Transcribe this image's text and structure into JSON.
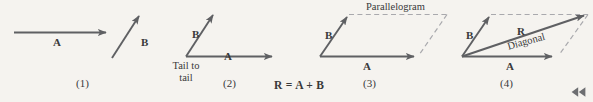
{
  "figure": {
    "colors": {
      "background": "#f5f3ef",
      "vector_stroke": "#5f6063",
      "dashed_stroke": "#a9a9ad",
      "text": "#39393a"
    },
    "formula": {
      "text": "R = A + B",
      "parts": {
        "result": "R",
        "equals": "=",
        "first": "A",
        "plus": "+",
        "second": "B"
      }
    },
    "panels": [
      {
        "number": "(1)",
        "caption": "(1)",
        "labels": [
          {
            "name": "vector-a-label",
            "text": "A"
          },
          {
            "name": "vector-b-label",
            "text": "B"
          }
        ]
      },
      {
        "number": "(2)",
        "caption": "(2)",
        "labels": [
          {
            "name": "vector-a-label",
            "text": "A"
          },
          {
            "name": "vector-b-label",
            "text": "B"
          },
          {
            "name": "tail-to-tail-label",
            "line1": "Tail to",
            "line2": "tail"
          }
        ]
      },
      {
        "number": "(3)",
        "caption": "(3)",
        "labels": [
          {
            "name": "vector-a-label",
            "text": "A"
          },
          {
            "name": "vector-b-label",
            "text": "B"
          },
          {
            "name": "parallelogram-label",
            "text": "Parallelogram"
          }
        ]
      },
      {
        "number": "(4)",
        "caption": "(4)",
        "labels": [
          {
            "name": "vector-a-label",
            "text": "A"
          },
          {
            "name": "vector-b-label",
            "text": "B"
          },
          {
            "name": "vector-r-label",
            "text": "R"
          },
          {
            "name": "diagonal-label",
            "text": "Diagonal"
          }
        ]
      }
    ]
  },
  "controls": {
    "rewind": {
      "icon": "rewind-icon",
      "label": "Rewind"
    }
  }
}
